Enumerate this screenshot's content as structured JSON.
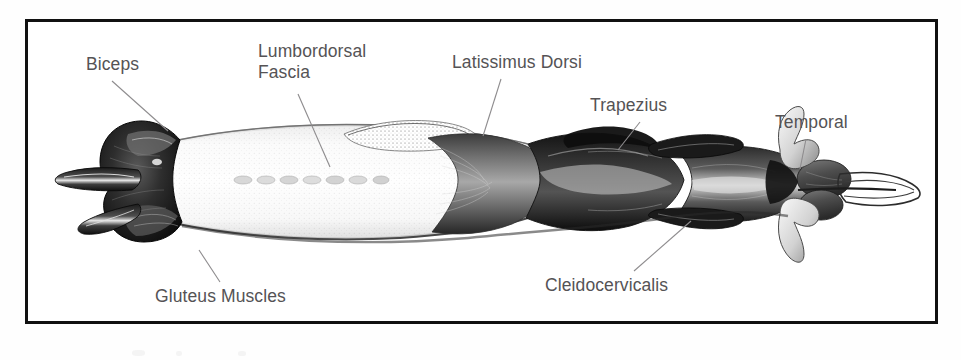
{
  "figure": {
    "kind": "anatomical-illustration",
    "view": "dorsal view of canine musculature",
    "frame_color": "#111111",
    "page_background": "#fefefe",
    "label_color": "#555355",
    "leader_line_color": "#8e8c8e"
  },
  "labels": [
    {
      "id": "biceps",
      "text": "Biceps",
      "lines": [
        "Biceps"
      ],
      "x": 86,
      "y": 54,
      "leader": {
        "x1": 112,
        "y1": 81,
        "x2": 168,
        "y2": 131
      }
    },
    {
      "id": "lumbordorsal-fascia",
      "text": "Lumbordorsal Fascia",
      "lines": [
        "Lumbordorsal",
        "Fascia"
      ],
      "x": 258,
      "y": 41,
      "leader": {
        "x1": 298,
        "y1": 94,
        "x2": 330,
        "y2": 167
      }
    },
    {
      "id": "latissimus-dorsi",
      "text": "Latissimus Dorsi",
      "lines": [
        "Latissimus Dorsi"
      ],
      "x": 452,
      "y": 52,
      "leader": {
        "x1": 501,
        "y1": 79,
        "x2": 483,
        "y2": 136
      }
    },
    {
      "id": "trapezius",
      "text": "Trapezius",
      "lines": [
        "Trapezius"
      ],
      "x": 590,
      "y": 95,
      "leader": {
        "x1": 640,
        "y1": 122,
        "x2": 618,
        "y2": 150
      }
    },
    {
      "id": "temporal",
      "text": "Temporal",
      "lines": [
        "Temporal"
      ],
      "x": 775,
      "y": 112,
      "leader": {
        "x1": 806,
        "y1": 139,
        "x2": 800,
        "y2": 169
      }
    },
    {
      "id": "gluteus-muscles",
      "text": "Gluteus Muscles",
      "lines": [
        "Gluteus Muscles"
      ],
      "x": 155,
      "y": 286,
      "leader": {
        "x1": 220,
        "y1": 282,
        "x2": 199,
        "y2": 250
      }
    },
    {
      "id": "cleidocervicalis",
      "text": "Cleidocervicalis",
      "lines": [
        "Cleidocervicalis"
      ],
      "x": 545,
      "y": 275,
      "leader": {
        "x1": 634,
        "y1": 271,
        "x2": 691,
        "y2": 221
      }
    }
  ]
}
